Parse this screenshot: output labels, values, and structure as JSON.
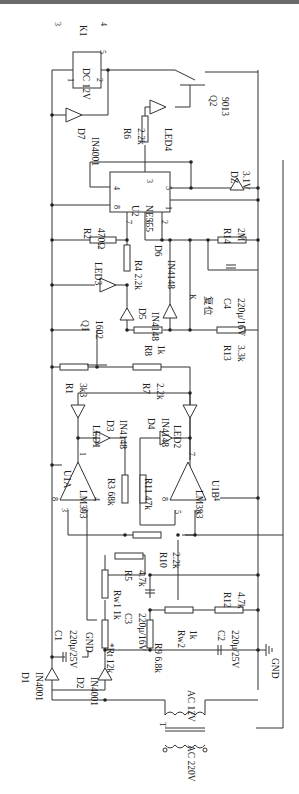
{
  "diagram": {
    "type": "circuit-schematic",
    "orientation": "rotated-90-ccw",
    "labels": [
      {
        "id": "k1",
        "text": "K1",
        "x": 80,
        "y": 25
      },
      {
        "id": "k1p3",
        "text": "3",
        "x": 55,
        "y": 22
      },
      {
        "id": "k1p4",
        "text": "4",
        "x": 101,
        "y": 22
      },
      {
        "id": "k1p5",
        "text": "5",
        "x": 100,
        "y": 50
      },
      {
        "id": "relay",
        "text": "DC 12V",
        "x": 83,
        "y": 68
      },
      {
        "id": "relay1",
        "text": "1",
        "x": 68,
        "y": 78
      },
      {
        "id": "relay2",
        "text": "2",
        "x": 97,
        "y": 78
      },
      {
        "id": "q2",
        "text": "Q2",
        "x": 210,
        "y": 95
      },
      {
        "id": "q2v",
        "text": "9013",
        "x": 222,
        "y": 97
      },
      {
        "id": "d7",
        "text": "D7",
        "x": 78,
        "y": 128
      },
      {
        "id": "d7v",
        "text": "IN4001",
        "x": 92,
        "y": 137
      },
      {
        "id": "r6",
        "text": "R6",
        "x": 124,
        "y": 128
      },
      {
        "id": "r6v",
        "text": "2.2k",
        "x": 138,
        "y": 128
      },
      {
        "id": "led4",
        "text": "LED4",
        "x": 165,
        "y": 128
      },
      {
        "id": "dz",
        "text": "DZ",
        "x": 231,
        "y": 171
      },
      {
        "id": "dzv",
        "text": "3.1V",
        "x": 243,
        "y": 171
      },
      {
        "id": "u2",
        "text": "U2",
        "x": 132,
        "y": 205
      },
      {
        "id": "u2v",
        "text": "NE555",
        "x": 146,
        "y": 205
      },
      {
        "id": "u2p4",
        "text": "4",
        "x": 114,
        "y": 186
      },
      {
        "id": "u2p8",
        "text": "8",
        "x": 114,
        "y": 205
      },
      {
        "id": "u2p3",
        "text": "3",
        "x": 147,
        "y": 179
      },
      {
        "id": "u2p5",
        "text": "5",
        "x": 166,
        "y": 186
      },
      {
        "id": "u2p1",
        "text": "1",
        "x": 166,
        "y": 206
      },
      {
        "id": "u2p7",
        "text": "7",
        "x": 126,
        "y": 220
      },
      {
        "id": "u2p6",
        "text": "6",
        "x": 146,
        "y": 220
      },
      {
        "id": "u2p2",
        "text": "2",
        "x": 162,
        "y": 220
      },
      {
        "id": "r2",
        "text": "R2",
        "x": 84,
        "y": 228
      },
      {
        "id": "r2v",
        "text": "470Ω",
        "x": 98,
        "y": 228
      },
      {
        "id": "r14",
        "text": "R14",
        "x": 224,
        "y": 228
      },
      {
        "id": "r14v",
        "text": "2M",
        "x": 238,
        "y": 228
      },
      {
        "id": "led3",
        "text": "LED3",
        "x": 95,
        "y": 262
      },
      {
        "id": "r4",
        "text": "R4 2.2k",
        "x": 135,
        "y": 260
      },
      {
        "id": "d6",
        "text": "D6",
        "x": 155,
        "y": 245
      },
      {
        "id": "d6v",
        "text": "IN4148",
        "x": 168,
        "y": 260
      },
      {
        "id": "k",
        "text": "K",
        "x": 190,
        "y": 294
      },
      {
        "id": "kv",
        "text": "复位",
        "x": 205,
        "y": 296
      },
      {
        "id": "c4",
        "text": "C4",
        "x": 224,
        "y": 298
      },
      {
        "id": "c4v",
        "text": "220μ/16V",
        "x": 238,
        "y": 298
      },
      {
        "id": "d5",
        "text": "D5",
        "x": 139,
        "y": 308
      },
      {
        "id": "d5v",
        "text": "IN4148",
        "x": 152,
        "y": 312
      },
      {
        "id": "q1",
        "text": "Q1",
        "x": 82,
        "y": 320
      },
      {
        "id": "q1v",
        "text": "1602",
        "x": 96,
        "y": 320
      },
      {
        "id": "r8",
        "text": "R8",
        "x": 145,
        "y": 345
      },
      {
        "id": "r8v",
        "text": "1k",
        "x": 158,
        "y": 345
      },
      {
        "id": "r13",
        "text": "R13",
        "x": 224,
        "y": 345
      },
      {
        "id": "r13v",
        "text": "3.3k",
        "x": 238,
        "y": 345
      },
      {
        "id": "r1",
        "text": "R1",
        "x": 66,
        "y": 383
      },
      {
        "id": "r1v",
        "text": "3k3",
        "x": 80,
        "y": 383
      },
      {
        "id": "r7",
        "text": "R7",
        "x": 143,
        "y": 383
      },
      {
        "id": "r7v",
        "text": "2.2k",
        "x": 157,
        "y": 383
      },
      {
        "id": "led1",
        "text": "LED1",
        "x": 93,
        "y": 425
      },
      {
        "id": "d3",
        "text": "D3",
        "x": 107,
        "y": 420
      },
      {
        "id": "d3v",
        "text": "IN4148",
        "x": 120,
        "y": 420
      },
      {
        "id": "d4",
        "text": "D4",
        "x": 148,
        "y": 418
      },
      {
        "id": "d4v",
        "text": "IN4148",
        "x": 162,
        "y": 418
      },
      {
        "id": "led2",
        "text": "LED2",
        "x": 174,
        "y": 425
      },
      {
        "id": "u1a",
        "text": "U1A",
        "x": 64,
        "y": 470
      },
      {
        "id": "u1av",
        "text": "LM393",
        "x": 80,
        "y": 490
      },
      {
        "id": "r3",
        "text": "R3 68k",
        "x": 108,
        "y": 478
      },
      {
        "id": "r11",
        "text": "R11 47k",
        "x": 145,
        "y": 478
      },
      {
        "id": "u1b",
        "text": "U1B",
        "x": 212,
        "y": 480
      },
      {
        "id": "u1bv",
        "text": "LM393",
        "x": 196,
        "y": 490
      },
      {
        "id": "u1a8",
        "text": "8",
        "x": 52,
        "y": 497
      },
      {
        "id": "u1a3",
        "text": "3",
        "x": 62,
        "y": 508
      },
      {
        "id": "u1a2",
        "text": "2",
        "x": 82,
        "y": 508
      },
      {
        "id": "u1a1",
        "text": "1",
        "x": 80,
        "y": 452
      },
      {
        "id": "u1a4",
        "text": "4",
        "x": 94,
        "y": 497
      },
      {
        "id": "u1b8",
        "text": "8",
        "x": 162,
        "y": 497
      },
      {
        "id": "u1b5",
        "text": "5",
        "x": 175,
        "y": 510
      },
      {
        "id": "u1b6",
        "text": "6",
        "x": 195,
        "y": 510
      },
      {
        "id": "u1b7",
        "text": "7",
        "x": 189,
        "y": 452
      },
      {
        "id": "u1b4",
        "text": "4",
        "x": 214,
        "y": 497
      },
      {
        "id": "r10",
        "text": "R10",
        "x": 160,
        "y": 552
      },
      {
        "id": "r10v",
        "text": "2.2k",
        "x": 173,
        "y": 552
      },
      {
        "id": "rw1",
        "text": "Rw1 1k",
        "x": 114,
        "y": 590
      },
      {
        "id": "r5",
        "text": "R5",
        "x": 125,
        "y": 570
      },
      {
        "id": "r5v",
        "text": "4.7k",
        "x": 139,
        "y": 570
      },
      {
        "id": "c3",
        "text": "C3",
        "x": 125,
        "y": 613
      },
      {
        "id": "c3v",
        "text": "220μ/16V",
        "x": 139,
        "y": 613
      },
      {
        "id": "r12",
        "text": "R12",
        "x": 224,
        "y": 592
      },
      {
        "id": "r12v",
        "text": "4.7k",
        "x": 238,
        "y": 592
      },
      {
        "id": "c1",
        "text": "C1",
        "x": 55,
        "y": 630
      },
      {
        "id": "c1v",
        "text": "220μ/25V",
        "x": 70,
        "y": 630
      },
      {
        "id": "gnd1",
        "text": "GND",
        "x": 86,
        "y": 632
      },
      {
        "id": "rt",
        "text": "*Rt 12k",
        "x": 107,
        "y": 643
      },
      {
        "id": "r9",
        "text": "R9 6.8k",
        "x": 155,
        "y": 643
      },
      {
        "id": "rw2",
        "text": "Rw2",
        "x": 178,
        "y": 630
      },
      {
        "id": "rw2v",
        "text": "1k",
        "x": 190,
        "y": 630
      },
      {
        "id": "c2",
        "text": "C2",
        "x": 218,
        "y": 630
      },
      {
        "id": "c2v",
        "text": "220μ/25V",
        "x": 232,
        "y": 630
      },
      {
        "id": "gnd2",
        "text": "GND",
        "x": 272,
        "y": 658
      },
      {
        "id": "d1",
        "text": "D1",
        "x": 22,
        "y": 672
      },
      {
        "id": "d1v",
        "text": "IN4001",
        "x": 36,
        "y": 672
      },
      {
        "id": "d2",
        "text": "D2",
        "x": 77,
        "y": 677
      },
      {
        "id": "d2v",
        "text": "IN4001",
        "x": 91,
        "y": 677
      },
      {
        "id": "ac12",
        "text": "AC 12V",
        "x": 188,
        "y": 690
      },
      {
        "id": "t",
        "text": "T",
        "x": 160,
        "y": 722
      },
      {
        "id": "ac220",
        "text": "AC 220V",
        "x": 188,
        "y": 745
      }
    ]
  }
}
